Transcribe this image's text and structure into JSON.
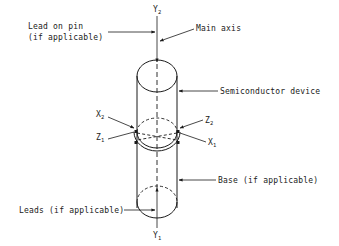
{
  "diagram": {
    "type": "semiconductor device orientation axes",
    "labels": {
      "lead_on_pin_line1": "Lead on pin",
      "lead_on_pin_line2": "(if applicable)",
      "main_axis": "Main axis",
      "semiconductor_device": "Semiconductor device",
      "base": "Base (if applicable)",
      "leads": "Leads (if applicable)"
    },
    "axes": {
      "y2": {
        "letter": "Y",
        "sub": "2"
      },
      "y1": {
        "letter": "Y",
        "sub": "1"
      },
      "x2": {
        "letter": "X",
        "sub": "2"
      },
      "x1": {
        "letter": "X",
        "sub": "1"
      },
      "z2": {
        "letter": "Z",
        "sub": "2"
      },
      "z1": {
        "letter": "Z",
        "sub": "1"
      }
    },
    "colors": {
      "line": "#1a1a1a",
      "background": "#ffffff"
    }
  }
}
